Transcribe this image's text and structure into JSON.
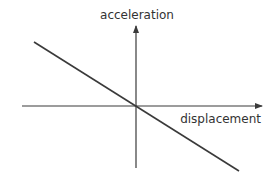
{
  "diagram": {
    "x_axis_label": "displacement",
    "y_axis_label": "acceleration",
    "relationship": "linear, negative slope through origin",
    "colors": {
      "line": "#3a3a3a",
      "axes": "#3a3a3a",
      "text": "#333333"
    }
  }
}
